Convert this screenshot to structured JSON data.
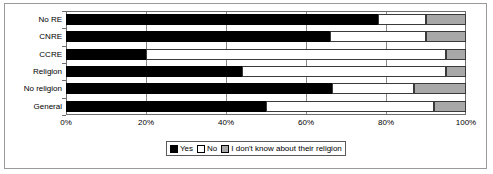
{
  "chart_data": {
    "type": "bar",
    "orientation": "horizontal",
    "stacked": true,
    "stack_mode": "percent",
    "title": "",
    "xlabel": "",
    "ylabel": "",
    "xlim": [
      0,
      100
    ],
    "xticks": [
      "0%",
      "20%",
      "40%",
      "60%",
      "80%",
      "100%"
    ],
    "xtick_values": [
      0,
      20,
      40,
      60,
      80,
      100
    ],
    "grid": true,
    "grid_axis": "x",
    "legend_position": "bottom-center",
    "categories": [
      "No RE",
      "CNRE",
      "CCRE",
      "Religion",
      "No religion",
      "General"
    ],
    "series": [
      {
        "name": "Yes",
        "color": "#000000",
        "values": [
          78,
          66,
          20,
          44,
          66.5,
          50
        ]
      },
      {
        "name": "No",
        "color": "#ffffff",
        "values": [
          12,
          24,
          75,
          51,
          20.5,
          42
        ]
      },
      {
        "name": "I don't know about their religion",
        "color": "#a8a8a8",
        "values": [
          10,
          10,
          5,
          5,
          13,
          8
        ]
      }
    ],
    "legend": [
      {
        "label": "Yes",
        "swatch": "black-square"
      },
      {
        "label": "No",
        "swatch": "white-square"
      },
      {
        "label": "I don't know about their religion",
        "swatch": "gray-square"
      }
    ]
  }
}
